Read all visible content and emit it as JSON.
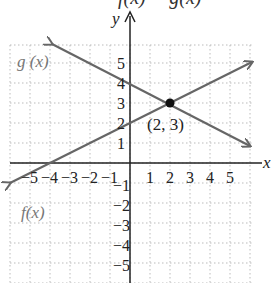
{
  "header": {
    "cut_title": "f(x) = g(x)"
  },
  "chart_data": {
    "type": "line",
    "title": "",
    "xlabel": "x",
    "ylabel": "y",
    "xlim": [
      -6,
      6
    ],
    "ylim": [
      -6,
      6
    ],
    "grid": true,
    "x_ticks": [
      -5,
      -4,
      -3,
      -2,
      -1,
      1,
      2,
      3,
      4,
      5
    ],
    "y_ticks": [
      5,
      4,
      3,
      2,
      1,
      -1,
      -2,
      -3,
      -4,
      -5
    ],
    "x_tick_labels": [
      "−5",
      "−4",
      "−3",
      "−2",
      "−1",
      "1",
      "2",
      "3",
      "4",
      "5"
    ],
    "y_tick_labels": [
      "5",
      "4",
      "3",
      "2",
      "1",
      "−1",
      "−2",
      "−3",
      "−4",
      "−5"
    ],
    "series": [
      {
        "name": "f(x)",
        "equation": "f(x) = x/2 + 2",
        "slope": 0.5,
        "intercept": 2,
        "x": [
          -6,
          6
        ],
        "y": [
          -1,
          5
        ],
        "color": "#666666"
      },
      {
        "name": "g(x)",
        "equation": "g(x) = -x/2 + 4",
        "slope": -0.5,
        "intercept": 4,
        "x": [
          -3.9,
          6
        ],
        "y": [
          5.95,
          1
        ],
        "color": "#666666"
      }
    ],
    "annotations": [
      {
        "type": "point",
        "x": 2,
        "y": 3,
        "label": "(2, 3)"
      },
      {
        "type": "label",
        "text": "g(x)",
        "near": "upper-left"
      },
      {
        "type": "label",
        "text": "f(x)",
        "near": "lower-left"
      }
    ]
  },
  "labels": {
    "y_axis": "y",
    "point": "(2, 3)",
    "f_label_main": "f",
    "f_label_paren": "(x)",
    "g_label": "g (x)"
  }
}
